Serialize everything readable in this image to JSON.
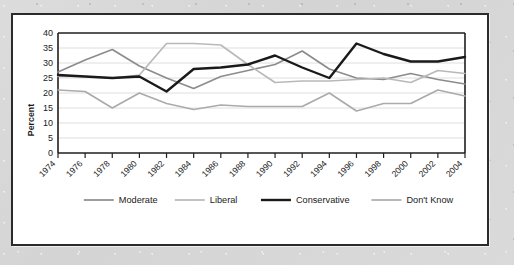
{
  "figure": {
    "frame_color": "#2b2b2b",
    "background_color": "#ffffff",
    "outer_background_color": "#d8d8d8"
  },
  "chart_data": {
    "type": "line",
    "title": "",
    "xlabel": "",
    "ylabel": "Percent",
    "ylim": [
      0,
      40
    ],
    "ytick_step": 5,
    "yticks": [
      "40",
      "35",
      "30",
      "25",
      "20",
      "15",
      "10",
      "5",
      "0"
    ],
    "grid": true,
    "legend_position": "bottom",
    "categories": [
      "1974",
      "1976",
      "1978",
      "1980",
      "1982",
      "1984",
      "1986",
      "1988",
      "1990",
      "1992",
      "1994",
      "1996",
      "1998",
      "2000",
      "2002",
      "2004"
    ],
    "series": [
      {
        "name": "Moderate",
        "color": "#8c8c8c",
        "width": 1.7,
        "values": [
          27.0,
          31.0,
          34.5,
          29.0,
          25.0,
          21.5,
          25.5,
          27.5,
          29.5,
          34.0,
          28.0,
          25.0,
          24.5,
          26.5,
          24.5,
          22.5
        ]
      },
      {
        "name": "Liberal",
        "color": "#b9b9b9",
        "width": 1.7,
        "values": [
          25.5,
          25.5,
          25.0,
          26.0,
          36.5,
          36.5,
          36.0,
          29.5,
          23.5,
          24.0,
          24.0,
          24.5,
          25.0,
          23.5,
          27.5,
          21.5
        ]
      },
      {
        "name": "Conservative",
        "color": "#1a1a1a",
        "width": 2.4,
        "values": [
          26.0,
          25.5,
          25.0,
          25.5,
          20.5,
          28.0,
          28.5,
          29.5,
          32.5,
          28.5,
          25.0,
          36.5,
          33.0,
          30.5,
          30.5,
          37.0
        ]
      },
      {
        "name": "Don't Know",
        "color": "#ababab",
        "width": 1.7,
        "values": [
          21.0,
          20.5,
          15.0,
          20.0,
          16.5,
          14.5,
          16.0,
          15.5,
          15.5,
          15.5,
          20.0,
          14.0,
          16.5,
          16.5,
          21.0,
          21.5
        ]
      }
    ],
    "series_endpoint_note": {
      "Conservative_last": 32.0,
      "Moderate_last": 23.0,
      "Liberal_last": 26.5,
      "Don't Know_last": 19.0
    }
  },
  "legend": {
    "items": [
      {
        "label": "Moderate",
        "color": "#8c8c8c",
        "width": 1.7
      },
      {
        "label": "Liberal",
        "color": "#b9b9b9",
        "width": 1.7
      },
      {
        "label": "Conservative",
        "color": "#1a1a1a",
        "width": 2.4
      },
      {
        "label": "Don't Know",
        "color": "#ababab",
        "width": 1.7
      }
    ]
  }
}
